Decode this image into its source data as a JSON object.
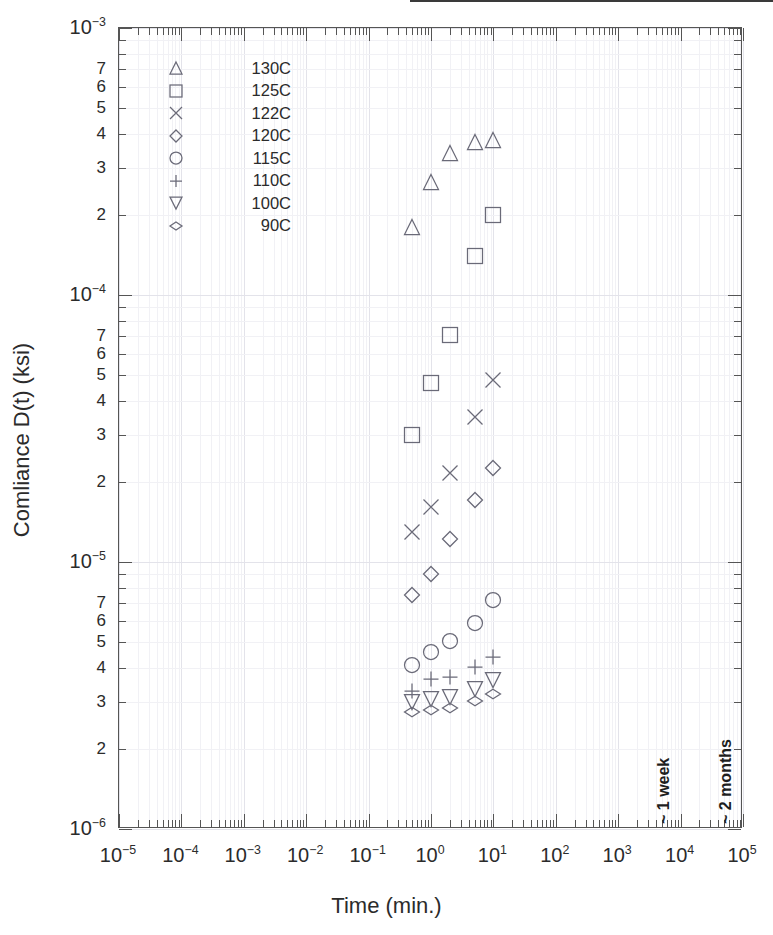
{
  "chart_data": {
    "type": "scatter",
    "title": "",
    "xlabel": "Time (min.)",
    "ylabel": "Comliance D(t) (ksi)",
    "xscale": "log",
    "yscale": "log",
    "xlim": [
      1e-05,
      100000.0
    ],
    "ylim": [
      1e-06,
      0.001
    ],
    "grid": true,
    "legend_position": "top-left-inside",
    "xticks": [
      "10⁻⁵",
      "10⁻⁴",
      "10⁻³",
      "10⁻²",
      "10⁻¹",
      "10⁰",
      "10¹",
      "10²",
      "10³",
      "10⁴",
      "10⁵"
    ],
    "xtick_exponents": [
      -5,
      -4,
      -3,
      -2,
      -1,
      0,
      1,
      2,
      3,
      4,
      5
    ],
    "ytick_exponents": [
      -3,
      -4,
      -5,
      -6
    ],
    "yminor_labels": [
      7,
      6,
      5,
      4,
      3,
      2
    ],
    "x_values": [
      0.5,
      1,
      2,
      5,
      10
    ],
    "series": [
      {
        "name": "130C",
        "marker": "triangle-up",
        "values": [
          0.00018,
          0.000265,
          0.00034,
          0.000375,
          0.00038
        ]
      },
      {
        "name": "125C",
        "marker": "square",
        "values": [
          3e-05,
          4.7e-05,
          7.1e-05,
          0.00014,
          0.0002
        ]
      },
      {
        "name": "122C",
        "marker": "cross",
        "values": [
          1.3e-05,
          1.6e-05,
          2.15e-05,
          3.5e-05,
          4.8e-05
        ]
      },
      {
        "name": "120C",
        "marker": "diamond",
        "values": [
          7.5e-06,
          9e-06,
          1.22e-05,
          1.7e-05,
          2.25e-05
        ]
      },
      {
        "name": "115C",
        "marker": "circle",
        "values": [
          4.1e-06,
          4.6e-06,
          5.05e-06,
          5.9e-06,
          7.2e-06
        ]
      },
      {
        "name": "110C",
        "marker": "plus",
        "values": [
          3.3e-06,
          3.65e-06,
          3.7e-06,
          4.05e-06,
          4.4e-06
        ]
      },
      {
        "name": "100C",
        "marker": "triangle-down",
        "values": [
          3e-06,
          3.08e-06,
          3.12e-06,
          3.35e-06,
          3.6e-06
        ]
      },
      {
        "name": "90C",
        "marker": "thin-diamond",
        "values": [
          2.75e-06,
          2.8e-06,
          2.85e-06,
          3.02e-06,
          3.2e-06
        ]
      }
    ],
    "annotations": [
      {
        "text": "~ 1 week",
        "x": 10000.0,
        "orientation": "vertical"
      },
      {
        "text": "~ 2 months",
        "x": 100000.0,
        "orientation": "vertical"
      }
    ]
  }
}
